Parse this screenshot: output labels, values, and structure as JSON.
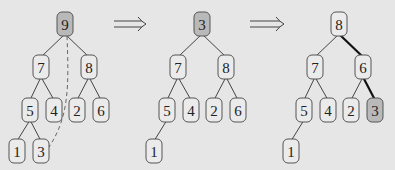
{
  "diagram": {
    "node_size": {
      "w": 16,
      "h": 24
    },
    "colors": {
      "background": "#e6e6e6",
      "node_fill": "#ebebeb",
      "highlight_fill": "#b9b9b9",
      "stroke": "#555555"
    },
    "trees": [
      {
        "id": "step1",
        "nodes": [
          {
            "id": "a",
            "label": "9",
            "x": 65,
            "y": 24,
            "highlight": true
          },
          {
            "id": "b",
            "label": "7",
            "x": 41,
            "y": 67
          },
          {
            "id": "c",
            "label": "8",
            "x": 89,
            "y": 67
          },
          {
            "id": "d",
            "label": "5",
            "x": 30,
            "y": 110
          },
          {
            "id": "e",
            "label": "4",
            "x": 54,
            "y": 110
          },
          {
            "id": "f",
            "label": "2",
            "x": 77,
            "y": 110
          },
          {
            "id": "g",
            "label": "6",
            "x": 101,
            "y": 110
          },
          {
            "id": "h",
            "label": "1",
            "x": 17,
            "y": 151
          },
          {
            "id": "i",
            "label": "3",
            "x": 41,
            "y": 151
          }
        ],
        "edges": [
          {
            "from": "a",
            "to": "b"
          },
          {
            "from": "a",
            "to": "c"
          },
          {
            "from": "b",
            "to": "d"
          },
          {
            "from": "b",
            "to": "e"
          },
          {
            "from": "c",
            "to": "f"
          },
          {
            "from": "c",
            "to": "g"
          },
          {
            "from": "d",
            "to": "h"
          },
          {
            "from": "d",
            "to": "i"
          },
          {
            "from": "a",
            "to": "i",
            "style": "dashed",
            "curve": true
          }
        ]
      },
      {
        "id": "step2",
        "nodes": [
          {
            "id": "a",
            "label": "3",
            "x": 202,
            "y": 24,
            "highlight": true
          },
          {
            "id": "b",
            "label": "7",
            "x": 178,
            "y": 67
          },
          {
            "id": "c",
            "label": "8",
            "x": 226,
            "y": 67
          },
          {
            "id": "d",
            "label": "5",
            "x": 167,
            "y": 110
          },
          {
            "id": "e",
            "label": "4",
            "x": 191,
            "y": 110
          },
          {
            "id": "f",
            "label": "2",
            "x": 214,
            "y": 110
          },
          {
            "id": "g",
            "label": "6",
            "x": 238,
            "y": 110
          },
          {
            "id": "h",
            "label": "1",
            "x": 154,
            "y": 151
          }
        ],
        "edges": [
          {
            "from": "a",
            "to": "b"
          },
          {
            "from": "a",
            "to": "c"
          },
          {
            "from": "b",
            "to": "d"
          },
          {
            "from": "b",
            "to": "e"
          },
          {
            "from": "c",
            "to": "f"
          },
          {
            "from": "c",
            "to": "g"
          },
          {
            "from": "d",
            "to": "h"
          }
        ]
      },
      {
        "id": "step3",
        "nodes": [
          {
            "id": "a",
            "label": "8",
            "x": 339,
            "y": 24
          },
          {
            "id": "b",
            "label": "7",
            "x": 315,
            "y": 67
          },
          {
            "id": "c",
            "label": "6",
            "x": 363,
            "y": 67
          },
          {
            "id": "d",
            "label": "5",
            "x": 304,
            "y": 110
          },
          {
            "id": "e",
            "label": "4",
            "x": 328,
            "y": 110
          },
          {
            "id": "f",
            "label": "2",
            "x": 351,
            "y": 110
          },
          {
            "id": "g",
            "label": "3",
            "x": 375,
            "y": 110,
            "highlight": true
          },
          {
            "id": "h",
            "label": "1",
            "x": 291,
            "y": 151
          }
        ],
        "edges": [
          {
            "from": "a",
            "to": "b"
          },
          {
            "from": "a",
            "to": "c",
            "style": "bold"
          },
          {
            "from": "b",
            "to": "d"
          },
          {
            "from": "b",
            "to": "e"
          },
          {
            "from": "c",
            "to": "f"
          },
          {
            "from": "c",
            "to": "g",
            "style": "bold"
          },
          {
            "from": "d",
            "to": "h"
          }
        ]
      }
    ],
    "arrows": [
      {
        "x1": 114,
        "x2": 146,
        "y": 24,
        "symbol": "⟹"
      },
      {
        "x1": 250,
        "x2": 284,
        "y": 24,
        "symbol": "⟹"
      }
    ]
  }
}
